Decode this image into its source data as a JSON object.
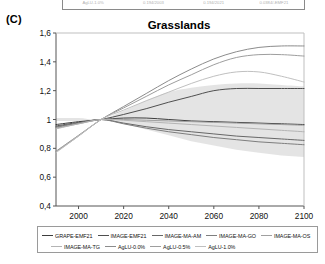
{
  "panel": {
    "label": "(C)"
  },
  "topstrip": {
    "cells": [
      "AgLU-1.0%",
      "0.194/2003",
      "0.194/2021",
      "0.0384/-EMF21"
    ]
  },
  "legend": {
    "position": "bottom",
    "rows": [
      [
        {
          "label": "GRAPE-EMF21",
          "color": "#3d3d3d"
        },
        {
          "label": "IMAGE-EMF21",
          "color": "#4f4f4f"
        },
        {
          "label": "IMAGE-MA-AM",
          "color": "#676767"
        },
        {
          "label": "IMAGE-MA-GO",
          "color": "#7e7e7e"
        },
        {
          "label": "IMAGE-MA-OS",
          "color": "#a0a0a0"
        }
      ],
      [
        {
          "label": "IMAGE-MA-TG",
          "color": "#b4b4b4"
        },
        {
          "label": "AgLU-0.0%",
          "color": "#8c8c8c"
        },
        {
          "label": "AgLU-0.5%",
          "color": "#9e9e9e"
        },
        {
          "label": "AgLU-1.0%",
          "color": "#c0c0c0"
        }
      ]
    ]
  },
  "chart_data": {
    "type": "line",
    "title": "Grasslands",
    "xlabel": "",
    "ylabel": "",
    "xlim": [
      1990,
      2100
    ],
    "ylim": [
      0.4,
      1.6
    ],
    "xticks": [
      2000,
      2020,
      2040,
      2060,
      2080,
      2100
    ],
    "xtick_labels": [
      "2000",
      "2020",
      "2040",
      "2060",
      "2080",
      "2100"
    ],
    "yticks": [
      0.4,
      0.6,
      0.8,
      1.0,
      1.2,
      1.4,
      1.6
    ],
    "ytick_labels": [
      "0,4",
      "0,6",
      "0,8",
      "1",
      "1,2",
      "1,4",
      "1,6"
    ],
    "grid": false,
    "decimal_separator": ",",
    "x": [
      1990,
      2000,
      2010,
      2020,
      2030,
      2040,
      2050,
      2060,
      2070,
      2080,
      2090,
      2100
    ],
    "band": {
      "name": "uncertainty-range",
      "color": "#e3e3e3",
      "upper": [
        1.01,
        1.01,
        1.0,
        1.06,
        1.13,
        1.19,
        1.22,
        1.24,
        1.25,
        1.25,
        1.24,
        1.23
      ],
      "lower": [
        0.99,
        0.99,
        1.0,
        0.97,
        0.93,
        0.89,
        0.85,
        0.82,
        0.79,
        0.77,
        0.75,
        0.74
      ]
    },
    "series": [
      {
        "name": "GRAPE-EMF21",
        "color": "#3d3d3d",
        "width": 1.0,
        "values": [
          0.965,
          0.985,
          1.0,
          1.01,
          1.01,
          1.0,
          0.99,
          0.985,
          0.98,
          0.975,
          0.97,
          0.965
        ]
      },
      {
        "name": "IMAGE-EMF21",
        "color": "#4f4f4f",
        "width": 1.0,
        "values": [
          0.955,
          0.98,
          1.0,
          1.035,
          1.075,
          1.12,
          1.16,
          1.2,
          1.215,
          1.215,
          1.215,
          1.215
        ]
      },
      {
        "name": "IMAGE-MA-AM",
        "color": "#676767",
        "width": 1.0,
        "values": [
          0.95,
          0.975,
          1.0,
          0.975,
          0.95,
          0.93,
          0.915,
          0.9,
          0.885,
          0.875,
          0.865,
          0.855
        ]
      },
      {
        "name": "IMAGE-MA-GO",
        "color": "#7e7e7e",
        "width": 1.0,
        "values": [
          0.945,
          0.975,
          1.0,
          0.97,
          0.94,
          0.915,
          0.895,
          0.875,
          0.86,
          0.845,
          0.835,
          0.825
        ]
      },
      {
        "name": "IMAGE-MA-OS",
        "color": "#a0a0a0",
        "width": 1.0,
        "values": [
          0.94,
          0.97,
          1.0,
          1.0,
          0.995,
          0.99,
          0.985,
          0.98,
          0.975,
          0.97,
          0.965,
          0.96
        ]
      },
      {
        "name": "IMAGE-MA-TG",
        "color": "#b4b4b4",
        "width": 1.0,
        "values": [
          0.935,
          0.97,
          1.0,
          0.995,
          0.985,
          0.975,
          0.965,
          0.955,
          0.945,
          0.935,
          0.925,
          0.915
        ]
      },
      {
        "name": "AgLU-0.0%",
        "color": "#8c8c8c",
        "width": 1.0,
        "values": [
          0.78,
          0.89,
          1.0,
          1.09,
          1.18,
          1.27,
          1.35,
          1.42,
          1.47,
          1.5,
          1.51,
          1.51
        ]
      },
      {
        "name": "AgLU-0.5%",
        "color": "#9e9e9e",
        "width": 1.0,
        "values": [
          0.775,
          0.885,
          1.0,
          1.08,
          1.16,
          1.24,
          1.31,
          1.38,
          1.43,
          1.45,
          1.45,
          1.44
        ]
      },
      {
        "name": "AgLU-1.0%",
        "color": "#c0c0c0",
        "width": 1.0,
        "values": [
          0.77,
          0.885,
          1.0,
          1.065,
          1.13,
          1.19,
          1.25,
          1.3,
          1.33,
          1.33,
          1.3,
          1.26
        ]
      }
    ]
  }
}
